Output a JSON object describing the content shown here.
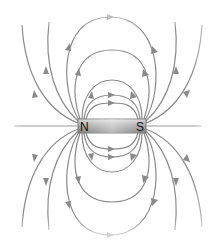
{
  "diagram": {
    "magnet": {
      "north_label": "N",
      "south_label": "S",
      "body_color": "#b8b8b8"
    },
    "field_line_color": "#8a8a8a",
    "arrow_direction": "from N to S outside the magnet"
  }
}
